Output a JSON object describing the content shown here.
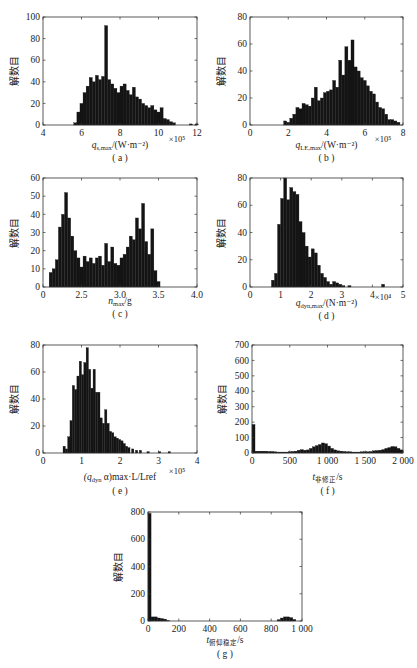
{
  "figure": {
    "y_label": "解数目",
    "panels": [
      {
        "id": "a",
        "caption": "( a )",
        "xlabel_main": "q",
        "xlabel_sub": "s,max",
        "xlabel_tail": "/(W·m⁻²)",
        "multiplier": "×10⁵"
      },
      {
        "id": "b",
        "caption": "( b )",
        "xlabel_main": "q",
        "xlabel_sub": "LE,max",
        "xlabel_tail": "/(W·m⁻²)",
        "multiplier": "×10⁵"
      },
      {
        "id": "c",
        "caption": "( c )",
        "xlabel_main": "n",
        "xlabel_sub": "max",
        "xlabel_tail": "/g",
        "multiplier": ""
      },
      {
        "id": "d",
        "caption": "( d )",
        "xlabel_main": "q",
        "xlabel_sub": "dyn,max",
        "xlabel_tail": "/(N·m⁻²)",
        "multiplier": "×10⁴"
      },
      {
        "id": "e",
        "caption": "( e )",
        "xlabel_main": "(q",
        "xlabel_sub": "dyn",
        "xlabel_tail": " α)max·L/Lref",
        "multiplier": "×10⁵"
      },
      {
        "id": "f",
        "caption": "( f )",
        "xlabel_main": "t",
        "xlabel_sub": "非修正",
        "xlabel_tail": "/s",
        "multiplier": ""
      },
      {
        "id": "g",
        "caption": "( g )",
        "xlabel_main": "t",
        "xlabel_sub": "俯仰稳定",
        "xlabel_tail": "/s",
        "multiplier": ""
      }
    ]
  },
  "chart_data": [
    {
      "type": "bar",
      "panel": "a",
      "title": "",
      "xlabel": "q_s,max/(W·m^-2) ×10^5",
      "ylabel": "解数目",
      "xlim": [
        4,
        12
      ],
      "ylim": [
        0,
        100
      ],
      "xticks": [
        4,
        6,
        8,
        10,
        12
      ],
      "yticks": [
        0,
        20,
        40,
        60,
        80,
        100
      ],
      "bin_width": 0.16,
      "x": [
        5.6,
        5.76,
        5.92,
        6.08,
        6.24,
        6.4,
        6.56,
        6.72,
        6.88,
        7.04,
        7.2,
        7.36,
        7.52,
        7.68,
        7.84,
        8.0,
        8.16,
        8.32,
        8.48,
        8.64,
        8.8,
        8.96,
        9.12,
        9.28,
        9.44,
        9.6,
        9.76,
        9.92,
        10.08,
        10.24,
        10.4,
        10.56,
        10.72,
        11.6,
        11.9
      ],
      "values": [
        2,
        12,
        20,
        30,
        36,
        44,
        40,
        46,
        42,
        45,
        92,
        42,
        38,
        34,
        30,
        36,
        38,
        32,
        28,
        35,
        26,
        24,
        20,
        18,
        16,
        18,
        14,
        12,
        16,
        6,
        5,
        3,
        2,
        1,
        1
      ]
    },
    {
      "type": "bar",
      "panel": "b",
      "title": "",
      "xlabel": "q_LE,max/(W·m^-2) ×10^5",
      "ylabel": "解数目",
      "xlim": [
        0,
        8
      ],
      "ylim": [
        0,
        80
      ],
      "xticks": [
        0,
        2,
        4,
        6,
        8
      ],
      "yticks": [
        0,
        20,
        40,
        60,
        80
      ],
      "bin_width": 0.16,
      "x": [
        1.76,
        1.92,
        2.08,
        2.24,
        2.4,
        2.56,
        2.72,
        2.88,
        3.04,
        3.2,
        3.36,
        3.52,
        3.68,
        3.84,
        4.0,
        4.16,
        4.32,
        4.48,
        4.64,
        4.8,
        4.96,
        5.12,
        5.28,
        5.44,
        5.6,
        5.76,
        5.92,
        6.08,
        6.24,
        6.4,
        6.56,
        6.72,
        6.88,
        7.04,
        7.2,
        7.36,
        7.52,
        7.68
      ],
      "values": [
        3,
        2,
        5,
        8,
        13,
        12,
        16,
        15,
        14,
        20,
        28,
        18,
        20,
        24,
        25,
        26,
        33,
        28,
        48,
        37,
        58,
        48,
        63,
        43,
        40,
        35,
        33,
        29,
        25,
        23,
        17,
        13,
        12,
        8,
        4,
        4,
        3,
        2
      ]
    },
    {
      "type": "bar",
      "panel": "c",
      "title": "",
      "xlabel": "n_max/g",
      "ylabel": "解数目",
      "xlim": [
        2.0,
        4.0
      ],
      "ylim": [
        0,
        60
      ],
      "xticks": [
        2.0,
        2.5,
        3.0,
        3.5,
        4.0
      ],
      "xticklabels": [
        "0",
        "2.5",
        "3.0",
        "3.5",
        "4.0"
      ],
      "yticks": [
        0,
        10,
        20,
        30,
        40,
        50,
        60
      ],
      "bin_width": 0.04,
      "x": [
        2.08,
        2.12,
        2.16,
        2.2,
        2.24,
        2.28,
        2.32,
        2.36,
        2.4,
        2.44,
        2.48,
        2.52,
        2.56,
        2.6,
        2.64,
        2.68,
        2.72,
        2.76,
        2.8,
        2.84,
        2.88,
        2.92,
        2.96,
        3.0,
        3.04,
        3.08,
        3.12,
        3.16,
        3.2,
        3.24,
        3.28,
        3.32,
        3.36,
        3.4,
        3.44,
        3.48
      ],
      "values": [
        8,
        10,
        15,
        33,
        40,
        52,
        38,
        28,
        20,
        16,
        11,
        17,
        14,
        16,
        13,
        16,
        17,
        12,
        24,
        14,
        22,
        13,
        12,
        16,
        18,
        22,
        28,
        26,
        38,
        32,
        46,
        25,
        18,
        32,
        9,
        3
      ]
    },
    {
      "type": "bar",
      "panel": "d",
      "title": "",
      "xlabel": "q_dyn,max/(N·m^-2) ×10^4",
      "ylabel": "解数目",
      "xlim": [
        0,
        5
      ],
      "ylim": [
        0,
        80
      ],
      "xticks": [
        0,
        1,
        2,
        3,
        4,
        5
      ],
      "yticks": [
        0,
        20,
        40,
        60,
        80
      ],
      "bin_width": 0.1,
      "x": [
        0.7,
        0.8,
        0.9,
        1.0,
        1.1,
        1.2,
        1.3,
        1.4,
        1.5,
        1.6,
        1.7,
        1.8,
        1.9,
        2.0,
        2.1,
        2.2,
        2.3,
        2.4,
        2.5,
        2.6,
        2.7,
        2.8,
        2.9,
        3.0,
        3.2,
        4.3
      ],
      "values": [
        5,
        10,
        46,
        65,
        81,
        64,
        73,
        70,
        68,
        48,
        40,
        30,
        22,
        28,
        25,
        16,
        10,
        7,
        4,
        2,
        4,
        3,
        2,
        1,
        1,
        2
      ]
    },
    {
      "type": "bar",
      "panel": "e",
      "title": "",
      "xlabel": "(q_dyn α)_max·L/L_ref ×10^5",
      "ylabel": "解数目",
      "xlim": [
        0,
        4
      ],
      "ylim": [
        0,
        80
      ],
      "xticks": [
        0,
        1,
        2,
        3,
        4
      ],
      "yticks": [
        0,
        20,
        40,
        60,
        80
      ],
      "bin_width": 0.06,
      "x": [
        0.52,
        0.58,
        0.64,
        0.7,
        0.76,
        0.82,
        0.88,
        0.94,
        1.0,
        1.06,
        1.12,
        1.18,
        1.24,
        1.3,
        1.36,
        1.42,
        1.48,
        1.54,
        1.6,
        1.66,
        1.72,
        1.78,
        1.84,
        1.9,
        1.96,
        2.02,
        2.08,
        2.14,
        2.2,
        2.3,
        2.4,
        2.5,
        2.7,
        3.0,
        3.25
      ],
      "values": [
        5,
        3,
        12,
        24,
        50,
        47,
        57,
        68,
        58,
        67,
        78,
        62,
        48,
        62,
        45,
        45,
        26,
        22,
        32,
        22,
        16,
        15,
        12,
        11,
        10,
        9,
        7,
        5,
        4,
        3,
        2,
        2,
        1,
        1,
        1
      ]
    },
    {
      "type": "bar",
      "panel": "f",
      "title": "",
      "xlabel": "t_非修正/s",
      "ylabel": "解数目",
      "xlim": [
        0,
        2000
      ],
      "ylim": [
        0,
        700
      ],
      "xticks": [
        0,
        500,
        1000,
        1500,
        2000
      ],
      "xticklabels": [
        "0",
        "500",
        "1 000",
        "1 500",
        "2 000"
      ],
      "yticks": [
        0,
        100,
        200,
        300,
        400,
        500,
        600,
        700
      ],
      "bin_width": 40,
      "x": [
        0,
        40,
        80,
        120,
        160,
        200,
        240,
        280,
        320,
        360,
        400,
        440,
        480,
        520,
        560,
        600,
        640,
        680,
        720,
        760,
        800,
        840,
        880,
        920,
        960,
        1000,
        1040,
        1080,
        1120,
        1160,
        1200,
        1240,
        1280,
        1320,
        1360,
        1400,
        1440,
        1480,
        1520,
        1560,
        1600,
        1640,
        1680,
        1720,
        1760,
        1800,
        1840,
        1880,
        1920,
        1960
      ],
      "values": [
        185,
        12,
        12,
        12,
        12,
        10,
        10,
        8,
        6,
        6,
        6,
        6,
        8,
        10,
        12,
        18,
        22,
        18,
        20,
        30,
        40,
        48,
        55,
        65,
        60,
        45,
        30,
        20,
        14,
        12,
        10,
        8,
        8,
        6,
        6,
        6,
        8,
        8,
        8,
        10,
        14,
        16,
        18,
        22,
        30,
        35,
        42,
        40,
        30,
        20
      ]
    },
    {
      "type": "bar",
      "panel": "g",
      "title": "",
      "xlabel": "t_俯仰稳定/s",
      "ylabel": "解数目",
      "xlim": [
        0,
        1000
      ],
      "ylim": [
        0,
        800
      ],
      "xticks": [
        0,
        200,
        400,
        600,
        800,
        1000
      ],
      "xticklabels": [
        "0",
        "200",
        "400",
        "600",
        "800",
        "1 000"
      ],
      "yticks": [
        0,
        200,
        400,
        600,
        800
      ],
      "bin_width": 20,
      "x": [
        0,
        20,
        40,
        60,
        80,
        100,
        120,
        840,
        860,
        880,
        900,
        920,
        940
      ],
      "values": [
        790,
        30,
        30,
        22,
        18,
        14,
        4,
        10,
        22,
        30,
        30,
        25,
        12
      ]
    }
  ]
}
